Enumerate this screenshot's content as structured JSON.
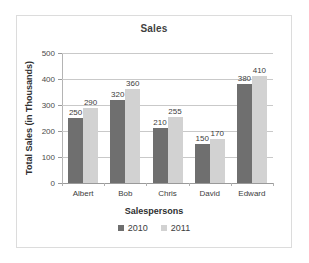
{
  "chart_data": {
    "type": "bar",
    "title": "Sales",
    "xlabel": "Salespersons",
    "ylabel": "Total Sales (in Thousands)",
    "categories": [
      "Albert",
      "Bob",
      "Chris",
      "David",
      "Edward"
    ],
    "series": [
      {
        "name": "2010",
        "values": [
          250,
          320,
          210,
          150,
          380
        ],
        "color": "#6f6f6f"
      },
      {
        "name": "2011",
        "values": [
          290,
          360,
          255,
          170,
          410
        ],
        "color": "#d2d2d2"
      }
    ],
    "ylim": [
      0,
      500
    ],
    "yticks": [
      500,
      400,
      300,
      200,
      100,
      0
    ],
    "ytick_labels": [
      "500",
      "400",
      "300",
      "200",
      "100",
      "0"
    ],
    "grid": true,
    "grid_axis": "y",
    "legend_position": "bottom",
    "data_labels": true
  },
  "colors": {
    "series_2010": "#6f6f6f",
    "series_2011": "#d2d2d2",
    "gridline": "#c9c9c9",
    "axis": "#9a9a9a",
    "border": "#dcdcdc",
    "background": "#ffffff",
    "text": "#3d3d3d"
  }
}
